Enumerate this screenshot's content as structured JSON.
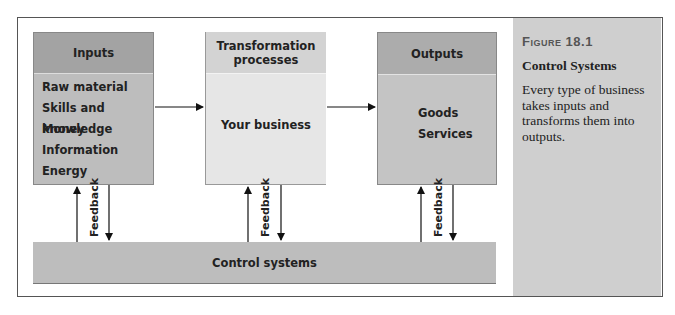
{
  "diagram": {
    "inputs": {
      "header": "Inputs",
      "items": [
        "Raw material",
        "Skills and knowledge",
        "Money",
        "Information",
        "Energy"
      ]
    },
    "transformation": {
      "header": "Transformation processes",
      "body": "Your business"
    },
    "outputs": {
      "header": "Outputs",
      "items": [
        "Goods",
        "Services"
      ]
    },
    "control": {
      "label": "Control systems"
    },
    "feedback_label": "Feedback",
    "feedback_labels": [
      "Feedback",
      "Feedback",
      "Feedback"
    ]
  },
  "caption": {
    "figure_label": "Figure 18.1",
    "title": "Control Systems",
    "description": "Every type of business takes inputs and transforms them into outputs."
  }
}
